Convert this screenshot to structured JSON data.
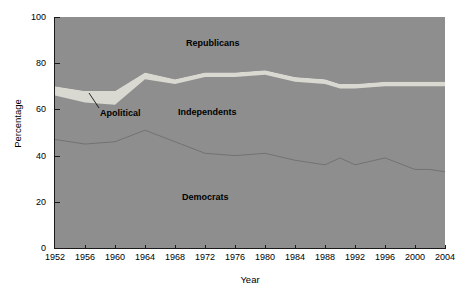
{
  "chart_data": {
    "type": "area",
    "title": "",
    "subtitle": "",
    "xlabel": "Year",
    "ylabel": "Percentage",
    "xlim": [
      1952,
      2004
    ],
    "ylim": [
      0,
      100
    ],
    "grid": false,
    "stacked": true,
    "legend_position": "in-plot-annotations",
    "x": [
      1952,
      1956,
      1960,
      1964,
      1968,
      1972,
      1976,
      1980,
      1984,
      1988,
      1990,
      1992,
      1996,
      2000,
      2002,
      2004
    ],
    "xticks": [
      "1952",
      "1956",
      "1960",
      "1964",
      "1968",
      "1972",
      "1976",
      "1980",
      "1984",
      "1988",
      "1992",
      "1996",
      "2000",
      "2004"
    ],
    "yticks": [
      "0",
      "20",
      "40",
      "60",
      "80",
      "100"
    ],
    "series": [
      {
        "name": "Democrats",
        "order": 1,
        "values": [
          47,
          45,
          46,
          51,
          46,
          41,
          40,
          41,
          38,
          36,
          39,
          36,
          39,
          34,
          34,
          33
        ]
      },
      {
        "name": "Independents",
        "order": 2,
        "values": [
          19,
          18,
          16,
          22,
          25,
          33,
          34,
          34,
          34,
          35,
          30,
          33,
          31,
          36,
          36,
          37
        ]
      },
      {
        "name": "Apolitical",
        "order": 3,
        "values": [
          4,
          5,
          6,
          3,
          2,
          2,
          2,
          2,
          2,
          2,
          2,
          2,
          2,
          2,
          2,
          2
        ]
      },
      {
        "name": "Republicans",
        "order": 4,
        "values": [
          30,
          32,
          32,
          24,
          27,
          24,
          24,
          23,
          26,
          27,
          29,
          29,
          28,
          28,
          28,
          28
        ]
      }
    ],
    "boundaries": {
      "note": "cumulative upper edge of each stacked band, percent",
      "democrats_top": [
        47,
        45,
        46,
        51,
        46,
        41,
        40,
        41,
        38,
        36,
        39,
        36,
        39,
        34,
        34,
        33
      ],
      "independents_top": [
        66,
        63,
        62,
        73,
        71,
        74,
        74,
        75,
        72,
        71,
        69,
        69,
        70,
        70,
        70,
        70
      ],
      "apolitical_top": [
        70,
        68,
        68,
        76,
        73,
        76,
        76,
        77,
        74,
        73,
        71,
        71,
        72,
        72,
        72,
        72
      ]
    },
    "annotations": [
      {
        "name": "apolitical-callout",
        "text": "Apolitical",
        "target_x": 1962,
        "target_y": 66
      }
    ],
    "colors": {
      "plot_background": "#8e8e8e",
      "democrats": "#8e8e8e",
      "independents": "#8e8e8e",
      "apolitical": "#d9d9d2",
      "republicans": "#8e8e8e",
      "boundary_line": "#6f6f6f",
      "axis": "#1a1a1a",
      "text": "#000000"
    }
  },
  "axes": {
    "y_title": "Percentage",
    "x_title": "Year",
    "y_ticks": [
      {
        "label": "100",
        "value": 100
      },
      {
        "label": "80",
        "value": 80
      },
      {
        "label": "60",
        "value": 60
      },
      {
        "label": "40",
        "value": 40
      },
      {
        "label": "20",
        "value": 20
      },
      {
        "label": "0",
        "value": 0
      }
    ],
    "x_ticks": [
      {
        "label": "1952",
        "value": 1952
      },
      {
        "label": "1956",
        "value": 1956
      },
      {
        "label": "1960",
        "value": 1960
      },
      {
        "label": "1964",
        "value": 1964
      },
      {
        "label": "1968",
        "value": 1968
      },
      {
        "label": "1972",
        "value": 1972
      },
      {
        "label": "1976",
        "value": 1976
      },
      {
        "label": "1980",
        "value": 1980
      },
      {
        "label": "1984",
        "value": 1984
      },
      {
        "label": "1988",
        "value": 1988
      },
      {
        "label": "1992",
        "value": 1992
      },
      {
        "label": "1996",
        "value": 1996
      },
      {
        "label": "2000",
        "value": 2000
      },
      {
        "label": "2004",
        "value": 2004
      }
    ]
  },
  "labels": {
    "republicans": "Republicans",
    "independents": "Independents",
    "apolitical": "Apolitical",
    "democrats": "Democrats"
  }
}
